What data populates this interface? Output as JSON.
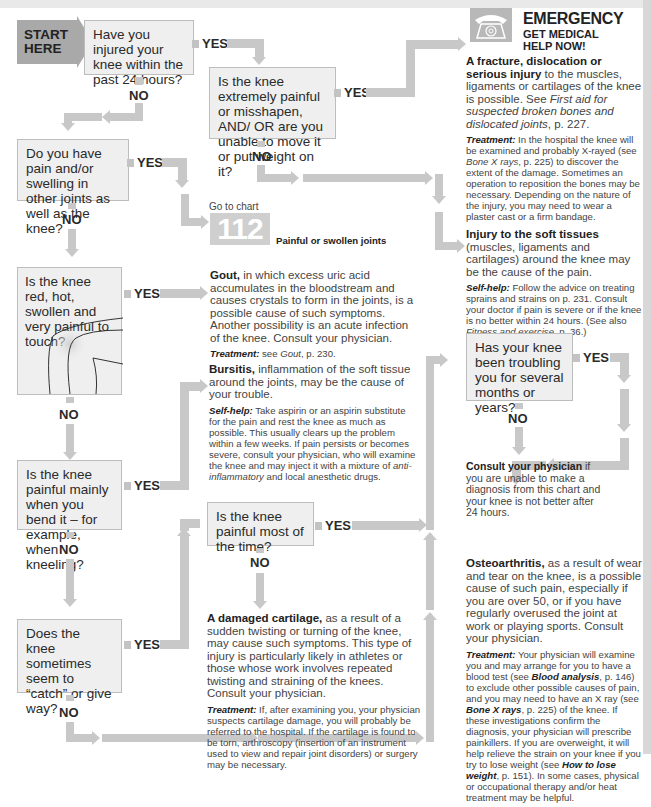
{
  "start": {
    "line1": "START",
    "line2": "HERE"
  },
  "labels": {
    "yes": "YES",
    "no": "NO"
  },
  "questions": {
    "q1": "Have you injured your knee within the past 24 hours?",
    "q2": "Is the knee extremely painful or misshapen, AND/ OR are you unable to move it or put weight on it?",
    "q3": "Do you have pain and/or swelling in other joints as well as the knee?",
    "q4": "Is the knee red, hot, swollen and very painful to touch?",
    "q5": "Is the knee painful mainly when you bend it – for example, when kneeling?",
    "q6": "Is the knee painful most of the time?",
    "q7": "Does the knee sometimes seem to “catch” or give way?",
    "q8": "Has your knee been troubling you for several months or years?"
  },
  "emergency": {
    "icon": "telephone-icon",
    "title": "EMERGENCY",
    "subtitle_1": "GET MEDICAL",
    "subtitle_2": "HELP NOW!",
    "bold_lead": "A fracture, dislocation or serious injury",
    "body": " to the muscles, ligaments or cartilages of the knee is possible. See ",
    "ref_italic": "First aid for suspected broken bones and dislocated joints",
    "ref_page": ", p. 227.",
    "treatment_label": "Treatment:",
    "treatment_1": " In the hospital the knee will be examined and probably X-rayed (see ",
    "treatment_ref": "Bone X rays",
    "treatment_2": ", p. 225) to discover the extent of the damage. Sometimes an operation to reposition the bones may be necessary. Depending on the nature of the injury, you may need to wear a plaster cast or a firm bandage."
  },
  "goto": {
    "prefix": "Go to chart",
    "chart_number": "112",
    "chart_title": "Painful or swollen joints"
  },
  "soft_tissue": {
    "bold_lead": "Injury to the soft tissues",
    "body": " (muscles, ligaments and cartilages) around the knee may be the cause of the pain.",
    "selfhelp_label": "Self-help:",
    "selfhelp_1": " Follow the advice on treating sprains and strains on p. 231. Consult your doctor if pain is severe or if the knee is no better within 24 hours. (See also ",
    "selfhelp_ref": "Fitness and exercise",
    "selfhelp_2": ", p. 36.)"
  },
  "gout": {
    "bold_lead": "Gout,",
    "body": " in which excess uric acid accumulates in the bloodstream and causes crystals to form in the joints, is a possible cause of such symptoms. Another possibility is an acute infection of the knee. Consult your physician.",
    "treatment_label": "Treatment:",
    "treatment_1": " see ",
    "treatment_ref": "Gout",
    "treatment_2": ", p. 230."
  },
  "bursitis": {
    "bold_lead": "Bursitis,",
    "body": " inflammation of the soft tissue around the joints, may be the cause of your trouble.",
    "selfhelp_label": "Self-help:",
    "selfhelp_1": " Take aspirin or an aspirin substitute for the pain and rest the knee as much as possible. This usually clears up the problem within a few weeks. If pain persists or becomes severe, consult your physician, who will examine the knee and may inject it with a mixture of ",
    "selfhelp_ref": "anti-inflammatory",
    "selfhelp_2": " and local anesthetic drugs."
  },
  "consult": {
    "bold_lead": "Consult your physician",
    "body": " if you are unable to make a diagnosis from this chart and your knee is not better after 24 hours."
  },
  "cartilage": {
    "bold_lead": "A damaged cartilage,",
    "body": " as a result of a sudden twisting or turning of the knee, may cause such symptoms. This type of injury is particularly likely in athletes or those whose work involves repeated twisting and straining of the knees. Consult your physician.",
    "treatment_label": "Treatment:",
    "treatment": " If, after examining you, your physician suspects cartilage damage, you will probably be referred to the hospital. If the cartilage is found to be torn, arthroscopy (insertion of an instrument used to view and repair joint disorders) or surgery may be necessary."
  },
  "osteo": {
    "bold_lead": "Osteoarthritis,",
    "body": " as a result of wear and tear on the knee, is a possible cause of such pain, especially if you are over 50, or if you have regularly overused the joint at work or playing sports. Consult your physician.",
    "treatment_label": "Treatment:",
    "treatment_1": " Your physician will examine you and may arrange for you to have a blood test (see ",
    "treatment_ref1": "Blood analysis",
    "treatment_2": ", p. 146) to exclude other possible causes of pain, and you may need to have an X ray (see ",
    "treatment_ref2": "Bone X rays",
    "treatment_3": ", p. 225) of the knee. If these investigations confirm the diagnosis, your physician will prescribe painkillers. If you are overweight, it will help relieve the strain on your knee if you try to lose weight (see ",
    "treatment_ref3": "How to lose weight",
    "treatment_4": ", p. 151). In some cases, physical or occupational therapy and/or heat treatment may be helpful."
  }
}
